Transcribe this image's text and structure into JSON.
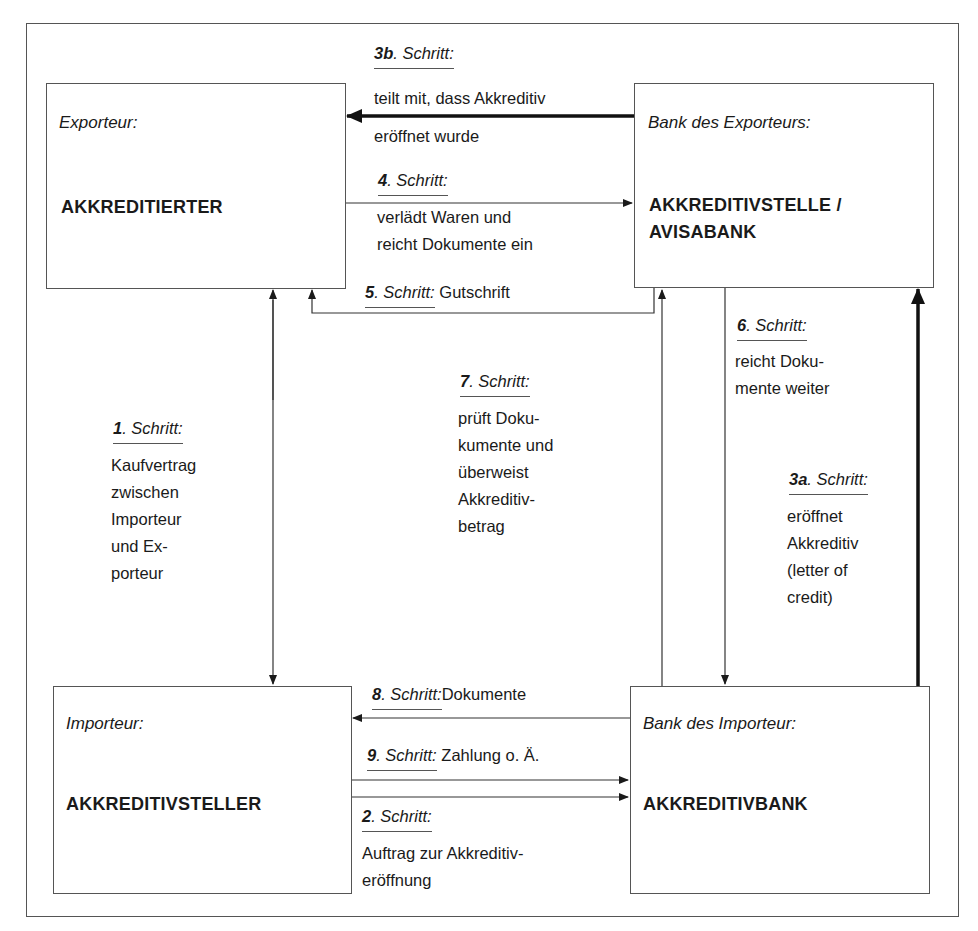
{
  "diagram": {
    "type": "flow",
    "topic": "Akkreditiv-Ablauf",
    "parties": {
      "exporter": {
        "role": "Exporteur:",
        "name": "AKKREDITIERTER"
      },
      "exporter_bank": {
        "role": "Bank des Exporteurs:",
        "name_line1": "AKKREDITIVSTELLE /",
        "name_line2": "AVISABANK"
      },
      "importer": {
        "role": "Importeur:",
        "name": "AKKREDITIVSTELLER"
      },
      "importer_bank": {
        "role": "Bank des Importeur:",
        "name": "AKKREDITIVBANK"
      }
    },
    "steps": {
      "s1": {
        "num": "1",
        "label": ". Schritt:",
        "desc": "Kaufvertrag\nzwischen\nImporteur\nund Ex-\nporteur",
        "from": "importer",
        "to": "exporter",
        "direction": "bidirectional"
      },
      "s2": {
        "num": "2",
        "label": ". Schritt:",
        "desc": "Auftrag zur Akkreditiv-\neröffnung",
        "from": "importer",
        "to": "importer_bank"
      },
      "s3a": {
        "num": "3a",
        "label": ". Schritt:",
        "desc": "eröffnet\nAkkreditiv\n(letter of\ncredit)",
        "from": "importer_bank",
        "to": "exporter_bank",
        "emphasis": "thick"
      },
      "s3b": {
        "num": "3b",
        "label": ". Schritt:",
        "desc_line1": "teilt mit, dass Akkreditiv",
        "desc_line2": "eröffnet wurde",
        "from": "exporter_bank",
        "to": "exporter",
        "emphasis": "thick"
      },
      "s4": {
        "num": "4",
        "label": ". Schritt:",
        "desc": "verlädt Waren und\nreicht Dokumente ein",
        "from": "exporter",
        "to": "exporter_bank"
      },
      "s5": {
        "num": "5",
        "label": ". Schritt:",
        "desc": "Gutschrift",
        "from": "exporter_bank",
        "to": "exporter"
      },
      "s6": {
        "num": "6",
        "label": ". Schritt:",
        "desc": "reicht Doku-\nmente weiter",
        "from": "exporter_bank",
        "to": "importer_bank"
      },
      "s7": {
        "num": "7",
        "label": ". Schritt:",
        "desc": "prüft Doku-\nkumente und\nüberweist\nAkkreditiv-\nbetrag",
        "from": "importer_bank",
        "to": "exporter_bank"
      },
      "s8": {
        "num": "8",
        "label": ". Schritt:",
        "desc": "Dokumente",
        "from": "importer_bank",
        "to": "importer"
      },
      "s9": {
        "num": "9",
        "label": ". Schritt:",
        "desc": "Zahlung o. Ä.",
        "from": "importer",
        "to": "importer_bank"
      }
    },
    "colors": {
      "line": "#1a1a1a",
      "border": "#555555",
      "text": "#1a1a1a",
      "background": "#ffffff"
    }
  }
}
